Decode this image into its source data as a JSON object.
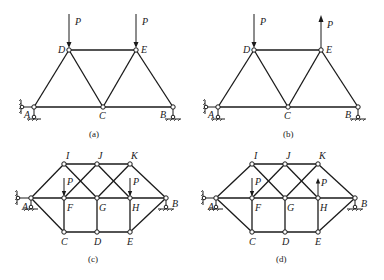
{
  "figures": [
    {
      "id": "a",
      "caption": "(a)",
      "labels": {
        "A": "A",
        "B": "B",
        "C": "C",
        "D": "D",
        "E": "E"
      },
      "loads": [
        {
          "node": "D",
          "label": "P",
          "direction": "down"
        },
        {
          "node": "E",
          "label": "P",
          "direction": "down"
        }
      ]
    },
    {
      "id": "b",
      "caption": "(b)",
      "labels": {
        "A": "A",
        "B": "B",
        "C": "C",
        "D": "D",
        "E": "E"
      },
      "loads": [
        {
          "node": "D",
          "label": "P",
          "direction": "down"
        },
        {
          "node": "E",
          "label": "P",
          "direction": "up"
        }
      ]
    },
    {
      "id": "c",
      "caption": "(c)",
      "labels": {
        "A": "A",
        "B": "B",
        "C": "C",
        "D": "D",
        "E": "E",
        "F": "F",
        "G": "G",
        "H": "H",
        "I": "I",
        "J": "J",
        "K": "K"
      },
      "loads": [
        {
          "node": "F",
          "label": "P",
          "direction": "down"
        },
        {
          "node": "H",
          "label": "P",
          "direction": "down"
        }
      ]
    },
    {
      "id": "d",
      "caption": "(d)",
      "labels": {
        "A": "A",
        "B": "B",
        "C": "C",
        "D": "D",
        "E": "E",
        "F": "F",
        "G": "G",
        "H": "H",
        "I": "I",
        "J": "J",
        "K": "K"
      },
      "loads": [
        {
          "node": "F",
          "label": "P",
          "direction": "down"
        },
        {
          "node": "H",
          "label": "P",
          "direction": "up"
        }
      ]
    }
  ]
}
